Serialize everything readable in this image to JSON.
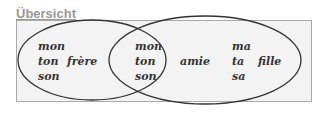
{
  "title": "Übersicht",
  "venn": {
    "left_only": [
      "mon",
      "ton",
      "son"
    ],
    "left_extra": "frère",
    "intersection": [
      "mon",
      "ton",
      "son"
    ],
    "right_mid": "amie",
    "right_only": [
      "ma",
      "ta",
      "sa"
    ],
    "right_extra": "fille"
  }
}
